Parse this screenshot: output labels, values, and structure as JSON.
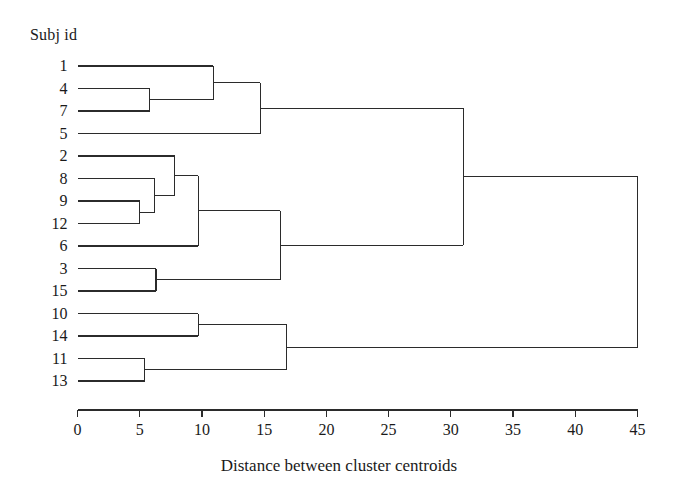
{
  "figure": {
    "corner_title": "Subj id",
    "axis_title": "Distance between cluster centroids",
    "line_color": "#2b2b2b",
    "background": "#ffffff"
  },
  "chart_data": {
    "type": "dendrogram",
    "title": "",
    "xlabel": "Distance between cluster centroids",
    "ylabel": "Subj id",
    "xlim": [
      0,
      45
    ],
    "xticks": [
      0,
      5,
      10,
      15,
      20,
      25,
      30,
      35,
      40,
      45
    ],
    "xtick_labels": [
      "0",
      "5",
      "10",
      "15",
      "20",
      "25",
      "30",
      "35",
      "40",
      "45"
    ],
    "grid": false,
    "legend": null,
    "orientation": "horizontal",
    "leaf_order": [
      "1",
      "4",
      "7",
      "5",
      "2",
      "8",
      "9",
      "12",
      "6",
      "3",
      "15",
      "10",
      "14",
      "11",
      "13"
    ],
    "leaf_labels": [
      "1",
      "4",
      "7",
      "5",
      "2",
      "8",
      "9",
      "12",
      "6",
      "3",
      "15",
      "10",
      "14",
      "11",
      "13"
    ],
    "merges": [
      {
        "id": "m1",
        "children": [
          "4",
          "7"
        ],
        "distance": 5.8
      },
      {
        "id": "m2",
        "children": [
          "1",
          "m1"
        ],
        "distance": 10.9
      },
      {
        "id": "m3",
        "children": [
          "m2",
          "5"
        ],
        "distance": 14.7
      },
      {
        "id": "m4",
        "children": [
          "9",
          "12"
        ],
        "distance": 5.0
      },
      {
        "id": "m5",
        "children": [
          "8",
          "m4"
        ],
        "distance": 6.2
      },
      {
        "id": "m6",
        "children": [
          "2",
          "m5"
        ],
        "distance": 7.8
      },
      {
        "id": "m7",
        "children": [
          "m6",
          "6"
        ],
        "distance": 9.7
      },
      {
        "id": "m8",
        "children": [
          "3",
          "15"
        ],
        "distance": 6.3
      },
      {
        "id": "m9",
        "children": [
          "m7",
          "m8"
        ],
        "distance": 16.3
      },
      {
        "id": "m10",
        "children": [
          "10",
          "14"
        ],
        "distance": 9.7
      },
      {
        "id": "m11",
        "children": [
          "11",
          "13"
        ],
        "distance": 5.4
      },
      {
        "id": "m12",
        "children": [
          "m10",
          "m11"
        ],
        "distance": 16.8
      },
      {
        "id": "m13",
        "children": [
          "m3",
          "m9"
        ],
        "distance": 31.0
      },
      {
        "id": "m14",
        "children": [
          "m13",
          "m12"
        ],
        "distance": 45.0
      }
    ]
  }
}
